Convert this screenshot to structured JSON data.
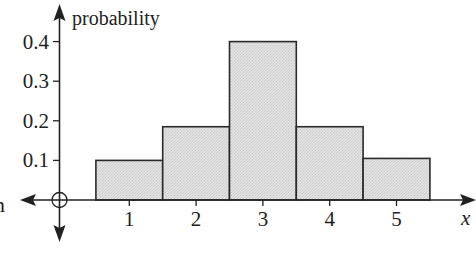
{
  "chart_data": {
    "type": "bar",
    "title": "",
    "xlabel": "x",
    "ylabel": "probability",
    "categories": [
      "1",
      "2",
      "3",
      "4",
      "5"
    ],
    "values": [
      0.1,
      0.185,
      0.4,
      0.185,
      0.105
    ],
    "yticks": [
      "0.1",
      "0.2",
      "0.3",
      "0.4"
    ],
    "ylim": [
      0,
      0.45
    ],
    "xlim": [
      0,
      6
    ],
    "grid": false,
    "legend": null,
    "bar_style": "adjacent (histogram style), light grey stippled fill, dark outline",
    "fill_color": "#dedede",
    "edge_color": "#2a2a2a",
    "origin_marker": "circle",
    "clipped_left_label_fragment": "n"
  }
}
